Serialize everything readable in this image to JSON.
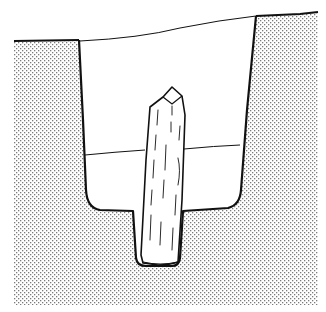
{
  "figure": {
    "title": "",
    "elements": [
      {
        "id": "ground",
        "label": "surrounding soil (stippled)"
      },
      {
        "id": "pit-fill-upper",
        "label": "upper fill layer"
      },
      {
        "id": "pit-fill-lower",
        "label": "lower fill layer"
      },
      {
        "id": "post-socket",
        "label": "narrow post socket at base"
      },
      {
        "id": "post",
        "label": "timber post"
      }
    ]
  },
  "colors": {
    "background": "#ffffff",
    "ink": "#111111",
    "stipple": "#7a7a7a"
  }
}
